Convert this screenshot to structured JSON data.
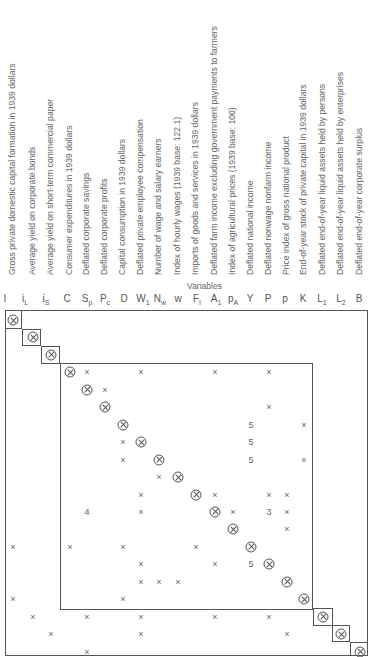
{
  "title": "Variables",
  "variables": [
    {
      "symbol": "I",
      "sub": "",
      "name": "Gross private domestic capital formation in 1939 dollars"
    },
    {
      "symbol": "i",
      "sub": "L",
      "name": "Average yield on corporate bonds"
    },
    {
      "symbol": "i",
      "sub": "S",
      "name": "Average yield on short-term commercial paper"
    },
    {
      "symbol": "C",
      "sub": "",
      "name": "Consumer expenditures in 1939 dollars"
    },
    {
      "symbol": "S",
      "sub": "p",
      "name": "Deflated corporate savings"
    },
    {
      "symbol": "P",
      "sub": "c",
      "name": "Deflated corporate profits"
    },
    {
      "symbol": "D",
      "sub": "",
      "name": "Capital consumption in 1939 dollars"
    },
    {
      "symbol": "W",
      "sub": "1",
      "name": "Deflated private employee compensation"
    },
    {
      "symbol": "N",
      "sub": "w",
      "name": "Number of wage and salary earners"
    },
    {
      "symbol": "w",
      "sub": "",
      "name": "Index of hourly wages (1939 base: 122.1)"
    },
    {
      "symbol": "F",
      "sub": "I",
      "name": "Imports of goods and services in 1939 dollars"
    },
    {
      "symbol": "A",
      "sub": "1",
      "name": "Deflated farm income excluding government payments to farmers"
    },
    {
      "symbol": "p",
      "sub": "A",
      "name": "Index of agricultural prices (1939 base: 100)"
    },
    {
      "symbol": "Y",
      "sub": "",
      "name": "Deflated national income"
    },
    {
      "symbol": "P",
      "sub": "",
      "name": "Deflated nonwage nonfarm income"
    },
    {
      "symbol": "p",
      "sub": "",
      "name": "Price index of gross national product"
    },
    {
      "symbol": "K",
      "sub": "",
      "name": "End-of-year stock of private capital in 1939 dollars"
    },
    {
      "symbol": "L",
      "sub": "1",
      "name": "Deflated end-of-year liquid assets held by persons"
    },
    {
      "symbol": "L",
      "sub": "2",
      "name": "Deflated end-of-year liquid assets held by enterprises"
    },
    {
      "symbol": "B",
      "sub": "",
      "name": "Deflated end-of-year corporate surplus"
    }
  ],
  "legend": {
    "diagonal": "⊗",
    "entry": "x"
  },
  "matrix_rows": [
    {
      "row": "I",
      "entries": [
        [
          0,
          "o"
        ]
      ]
    },
    {
      "row": "iL",
      "entries": [
        [
          1,
          "o"
        ]
      ]
    },
    {
      "row": "iS",
      "entries": [
        [
          2,
          "o"
        ]
      ]
    },
    {
      "row": "C",
      "entries": [
        [
          3,
          "o"
        ],
        [
          4,
          "x"
        ],
        [
          7,
          "x"
        ],
        [
          11,
          "x"
        ],
        [
          14,
          "x"
        ]
      ]
    },
    {
      "row": "Sp",
      "entries": [
        [
          4,
          "o"
        ],
        [
          5,
          "x"
        ]
      ]
    },
    {
      "row": "Pc",
      "entries": [
        [
          5,
          "o"
        ],
        [
          14,
          "x"
        ]
      ]
    },
    {
      "row": "D",
      "entries": [
        [
          6,
          "o"
        ],
        [
          13,
          "5"
        ],
        [
          16,
          "x"
        ]
      ]
    },
    {
      "row": "W1",
      "entries": [
        [
          6,
          "x"
        ],
        [
          7,
          "o"
        ],
        [
          13,
          "5"
        ]
      ]
    },
    {
      "row": "Nw",
      "entries": [
        [
          6,
          "x"
        ],
        [
          8,
          "o"
        ],
        [
          13,
          "5"
        ],
        [
          16,
          "x"
        ]
      ]
    },
    {
      "row": "w",
      "entries": [
        [
          8,
          "x"
        ],
        [
          9,
          "o"
        ]
      ]
    },
    {
      "row": "FI",
      "entries": [
        [
          7,
          "x"
        ],
        [
          10,
          "o"
        ],
        [
          11,
          "x"
        ],
        [
          14,
          "x"
        ],
        [
          15,
          "x"
        ]
      ]
    },
    {
      "row": "A1",
      "entries": [
        [
          4,
          "4"
        ],
        [
          7,
          "x"
        ],
        [
          11,
          "o"
        ],
        [
          12,
          "x"
        ],
        [
          14,
          "3"
        ],
        [
          15,
          "x"
        ]
      ]
    },
    {
      "row": "pA",
      "entries": [
        [
          12,
          "o"
        ],
        [
          15,
          "x"
        ]
      ]
    },
    {
      "row": "Y",
      "entries": [
        [
          0,
          "x"
        ],
        [
          3,
          "x"
        ],
        [
          6,
          "x"
        ],
        [
          10,
          "x"
        ],
        [
          13,
          "o"
        ]
      ]
    },
    {
      "row": "P",
      "entries": [
        [
          7,
          "x"
        ],
        [
          11,
          "x"
        ],
        [
          13,
          "5"
        ],
        [
          14,
          "o"
        ]
      ]
    },
    {
      "row": "p",
      "entries": [
        [
          7,
          "x"
        ],
        [
          8,
          "x"
        ],
        [
          9,
          "x"
        ],
        [
          15,
          "o"
        ]
      ]
    },
    {
      "row": "K",
      "entries": [
        [
          0,
          "x"
        ],
        [
          6,
          "x"
        ],
        [
          16,
          "o"
        ]
      ]
    },
    {
      "row": "L1",
      "entries": [
        [
          1,
          "x"
        ],
        [
          4,
          "x"
        ],
        [
          7,
          "x"
        ],
        [
          11,
          "x"
        ],
        [
          14,
          "x"
        ],
        [
          17,
          "o"
        ]
      ]
    },
    {
      "row": "L2",
      "entries": [
        [
          2,
          "x"
        ],
        [
          7,
          "x"
        ],
        [
          15,
          "x"
        ],
        [
          18,
          "o"
        ]
      ]
    },
    {
      "row": "B",
      "entries": [
        [
          4,
          "x"
        ],
        [
          19,
          "o"
        ]
      ]
    }
  ]
}
